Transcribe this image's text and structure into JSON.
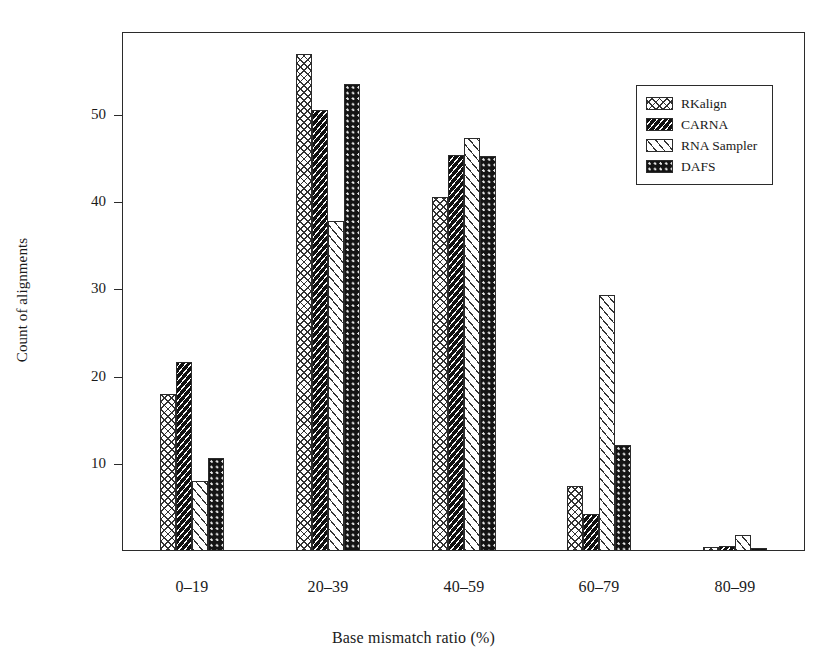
{
  "chart_data": {
    "type": "bar",
    "title": "",
    "xlabel": "Base  mismatch ratio (%)",
    "ylabel": "Count of alignments",
    "categories": [
      "0–19",
      "20–39",
      "40–59",
      "60–79",
      "80–99"
    ],
    "yticks": [
      10,
      20,
      30,
      40,
      50
    ],
    "ytick_labels": [
      "10",
      "20",
      "30",
      "40",
      "50"
    ],
    "ylim": [
      0,
      58
    ],
    "grid": false,
    "legend_position": "top-right-inside",
    "series": [
      {
        "name": "RKalign",
        "pattern": "cross-hatch-light",
        "values": [
          18.0,
          57.0,
          40.6,
          7.5,
          0.5
        ]
      },
      {
        "name": "CARNA",
        "pattern": "dense-diagonal-dark",
        "values": [
          21.7,
          50.6,
          45.4,
          4.3,
          0.6
        ]
      },
      {
        "name": "RNA Sampler",
        "pattern": "sparse-diagonal-light",
        "values": [
          8.0,
          37.8,
          47.4,
          29.4,
          1.8
        ]
      },
      {
        "name": "DAFS",
        "pattern": "speckled-dark",
        "values": [
          10.7,
          53.6,
          45.3,
          12.2,
          0.4
        ]
      }
    ]
  },
  "axes": {
    "frame_color": "#2b2b2b",
    "background": "#ffffff"
  }
}
